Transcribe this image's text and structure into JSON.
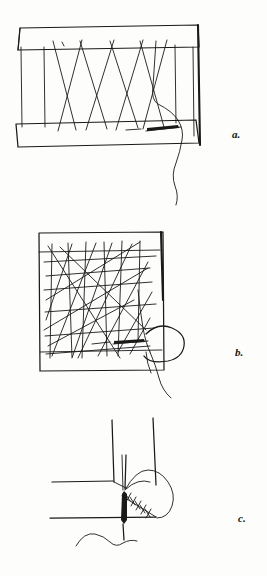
{
  "page": {
    "kind": "scanned-line-illustration",
    "background_color": "#fdfdfc",
    "ink_color": "#1a1a1a",
    "width": 267,
    "height": 576
  },
  "figures": [
    {
      "id": "a",
      "label": "a.",
      "caption_position": "right",
      "description": "Rectangular darning frame, warp threads laid vertically across the opening with crossing diagonal threads; needle and trailing thread at lower right"
    },
    {
      "id": "b",
      "label": "b.",
      "caption_position": "right",
      "description": "Square darning frame with dense interlaced weft threads woven through the warp; hand and needle at the right edge with thread hanging below"
    },
    {
      "id": "c",
      "label": "c.",
      "caption_position": "right",
      "description": "Close-up detail of the needle passing through fabric corner with a line of cross stitches and a wavy thread"
    }
  ],
  "labels": {
    "a": "a.",
    "b": "b.",
    "c": "c."
  }
}
